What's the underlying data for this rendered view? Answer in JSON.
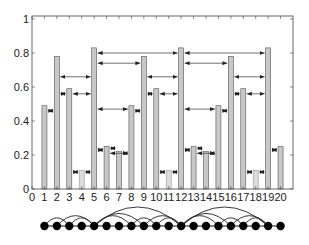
{
  "chart_data": {
    "type": "bar",
    "title": "",
    "xlabel": "",
    "ylabel": "",
    "xlim": [
      0,
      21
    ],
    "ylim": [
      0,
      1
    ],
    "grid": false,
    "x_ticks": [
      "0",
      "1",
      "2",
      "3",
      "4",
      "5",
      "6",
      "7",
      "8",
      "9",
      "10",
      "11",
      "12",
      "13",
      "14",
      "15",
      "16",
      "17",
      "18",
      "19",
      "20"
    ],
    "y_ticks": [
      "0",
      "0.2",
      "0.4",
      "0.6",
      "0.8",
      "1"
    ],
    "categories": [
      1,
      2,
      3,
      4,
      5,
      6,
      7,
      8,
      9,
      10,
      11,
      12,
      13,
      14,
      15,
      16,
      17,
      18,
      19,
      20
    ],
    "values": [
      0.49,
      0.78,
      0.59,
      0.11,
      0.83,
      0.25,
      0.22,
      0.49,
      0.78,
      0.59,
      0.11,
      0.83,
      0.25,
      0.22,
      0.49,
      0.78,
      0.59,
      0.11,
      0.83,
      0.25
    ],
    "bar_colors": {
      "normal": "#c8c8c8",
      "light": "#dcdcdc",
      "edge": "#555555"
    },
    "light_bars": [
      4,
      11,
      18
    ],
    "arrows": [
      {
        "from": 1,
        "to": 2,
        "y": 0.46
      },
      {
        "from": 2,
        "to": 3,
        "y": 0.56
      },
      {
        "from": 3,
        "to": 5,
        "y": 0.56
      },
      {
        "from": 2,
        "to": 5,
        "y": 0.66
      },
      {
        "from": 3,
        "to": 4,
        "y": 0.1
      },
      {
        "from": 4,
        "to": 5,
        "y": 0.1
      },
      {
        "from": 5,
        "to": 6,
        "y": 0.23
      },
      {
        "from": 6,
        "to": 7,
        "y": 0.24
      },
      {
        "from": 6,
        "to": 8,
        "y": 0.21
      },
      {
        "from": 7,
        "to": 8,
        "y": 0.21
      },
      {
        "from": 5,
        "to": 8,
        "y": 0.47
      },
      {
        "from": 8,
        "to": 9,
        "y": 0.46
      },
      {
        "from": 5,
        "to": 9,
        "y": 0.74
      },
      {
        "from": 5,
        "to": 12,
        "y": 0.8
      },
      {
        "from": 9,
        "to": 10,
        "y": 0.56
      },
      {
        "from": 10,
        "to": 12,
        "y": 0.56
      },
      {
        "from": 9,
        "to": 12,
        "y": 0.66
      },
      {
        "from": 10,
        "to": 11,
        "y": 0.1
      },
      {
        "from": 11,
        "to": 12,
        "y": 0.1
      },
      {
        "from": 12,
        "to": 13,
        "y": 0.23
      },
      {
        "from": 13,
        "to": 14,
        "y": 0.24
      },
      {
        "from": 13,
        "to": 15,
        "y": 0.21
      },
      {
        "from": 14,
        "to": 15,
        "y": 0.21
      },
      {
        "from": 12,
        "to": 15,
        "y": 0.47
      },
      {
        "from": 15,
        "to": 16,
        "y": 0.46
      },
      {
        "from": 12,
        "to": 16,
        "y": 0.74
      },
      {
        "from": 12,
        "to": 19,
        "y": 0.8
      },
      {
        "from": 16,
        "to": 17,
        "y": 0.56
      },
      {
        "from": 17,
        "to": 19,
        "y": 0.56
      },
      {
        "from": 16,
        "to": 19,
        "y": 0.66
      },
      {
        "from": 17,
        "to": 18,
        "y": 0.1
      },
      {
        "from": 18,
        "to": 19,
        "y": 0.1
      },
      {
        "from": 19,
        "to": 20,
        "y": 0.23
      }
    ],
    "graph": {
      "nodes": [
        1,
        2,
        3,
        4,
        5,
        6,
        7,
        8,
        9,
        10,
        11,
        12,
        13,
        14,
        15,
        16,
        17,
        18,
        19,
        20
      ],
      "arcs": [
        [
          1,
          3
        ],
        [
          2,
          5
        ],
        [
          3,
          5
        ],
        [
          5,
          8
        ],
        [
          5,
          9
        ],
        [
          5,
          12
        ],
        [
          8,
          10
        ],
        [
          9,
          12
        ],
        [
          10,
          12
        ],
        [
          12,
          15
        ],
        [
          12,
          16
        ],
        [
          12,
          19
        ],
        [
          15,
          17
        ],
        [
          16,
          19
        ],
        [
          17,
          19
        ]
      ]
    }
  }
}
